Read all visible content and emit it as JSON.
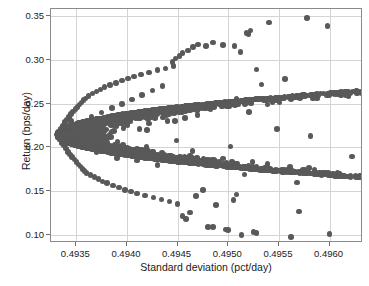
{
  "chart_data": {
    "type": "scatter",
    "title": "",
    "xlabel": "Standard deviation (pct/day)",
    "ylabel": "Return (bps/day)",
    "xlim": [
      0.49325,
      0.49633
    ],
    "ylim": [
      0.0905,
      0.3585
    ],
    "xticks": [
      0.4935,
      0.494,
      0.4945,
      0.495,
      0.4955,
      0.496
    ],
    "xticklabels": [
      "0.4935",
      "0.4940",
      "0.4945",
      "0.4950",
      "0.4955",
      "0.4960"
    ],
    "yticks": [
      0.1,
      0.15,
      0.2,
      0.25,
      0.3,
      0.35
    ],
    "yticklabels": [
      "0.10",
      "0.15",
      "0.20",
      "0.25",
      "0.30",
      "0.35"
    ],
    "grid": true,
    "legend": null,
    "marker_color": "#595959",
    "marker_size_px": 5.6,
    "n_points_drawn": 1000,
    "envelope": {
      "apex_x": 0.49331,
      "apex_y": 0.2145,
      "curvature_note": "left boundary x = apex_x + k*(y-apex_y)^2, k approx 0.00112/unit^2 upper, 0.00118/unit^2 lower"
    },
    "points": [
      [
        0.49331,
        0.2148
      ],
      [
        0.49332,
        0.212
      ],
      [
        0.49333,
        0.218
      ],
      [
        0.49334,
        0.209
      ],
      [
        0.49335,
        0.221
      ],
      [
        0.49336,
        0.205
      ],
      [
        0.49337,
        0.225
      ],
      [
        0.49338,
        0.202
      ],
      [
        0.49339,
        0.229
      ],
      [
        0.4934,
        0.1985
      ],
      [
        0.49341,
        0.232
      ],
      [
        0.49342,
        0.195
      ],
      [
        0.49343,
        0.235
      ],
      [
        0.49344,
        0.192
      ],
      [
        0.49345,
        0.2385
      ],
      [
        0.49346,
        0.189
      ],
      [
        0.49347,
        0.241
      ],
      [
        0.49348,
        0.186
      ],
      [
        0.49349,
        0.244
      ],
      [
        0.4935,
        0.183
      ],
      [
        0.49351,
        0.2465
      ],
      [
        0.49352,
        0.1805
      ],
      [
        0.49353,
        0.249
      ],
      [
        0.49354,
        0.178
      ],
      [
        0.49355,
        0.2515
      ],
      [
        0.49356,
        0.1755
      ],
      [
        0.49357,
        0.254
      ],
      [
        0.49358,
        0.173
      ],
      [
        0.49359,
        0.256
      ],
      [
        0.4936,
        0.171
      ],
      [
        0.49362,
        0.259
      ],
      [
        0.49364,
        0.1685
      ],
      [
        0.49366,
        0.2615
      ],
      [
        0.49368,
        0.166
      ],
      [
        0.4937,
        0.264
      ],
      [
        0.49372,
        0.1635
      ],
      [
        0.49374,
        0.2665
      ],
      [
        0.49376,
        0.161
      ],
      [
        0.49378,
        0.269
      ],
      [
        0.4938,
        0.159
      ],
      [
        0.49383,
        0.2715
      ],
      [
        0.49386,
        0.1565
      ],
      [
        0.49389,
        0.274
      ],
      [
        0.49392,
        0.154
      ],
      [
        0.49395,
        0.2765
      ],
      [
        0.49398,
        0.1515
      ],
      [
        0.49401,
        0.279
      ],
      [
        0.49404,
        0.1495
      ],
      [
        0.49407,
        0.281
      ],
      [
        0.4941,
        0.147
      ],
      [
        0.49414,
        0.2835
      ],
      [
        0.49418,
        0.145
      ],
      [
        0.49422,
        0.286
      ],
      [
        0.49426,
        0.1425
      ],
      [
        0.4943,
        0.2885
      ],
      [
        0.49434,
        0.1405
      ],
      [
        0.49438,
        0.2905
      ],
      [
        0.49442,
        0.138
      ],
      [
        0.49446,
        0.293
      ],
      [
        0.4945,
        0.1355
      ],
      [
        0.4934,
        0.22
      ],
      [
        0.49345,
        0.23
      ],
      [
        0.4935,
        0.215
      ],
      [
        0.49355,
        0.225
      ],
      [
        0.4936,
        0.205
      ],
      [
        0.49365,
        0.235
      ],
      [
        0.4937,
        0.195
      ],
      [
        0.49375,
        0.24
      ],
      [
        0.4938,
        0.21
      ],
      [
        0.49385,
        0.245
      ],
      [
        0.4939,
        0.188
      ],
      [
        0.49395,
        0.25
      ],
      [
        0.494,
        0.2
      ],
      [
        0.49405,
        0.255
      ],
      [
        0.4941,
        0.185
      ],
      [
        0.49415,
        0.26
      ],
      [
        0.4942,
        0.22
      ],
      [
        0.49425,
        0.265
      ],
      [
        0.4943,
        0.18
      ],
      [
        0.49435,
        0.27
      ],
      [
        0.4944,
        0.23
      ],
      [
        0.49445,
        0.298
      ],
      [
        0.49448,
        0.302
      ],
      [
        0.49452,
        0.305
      ],
      [
        0.49455,
        0.308
      ],
      [
        0.4946,
        0.311
      ],
      [
        0.49465,
        0.315
      ],
      [
        0.4947,
        0.318
      ],
      [
        0.49478,
        0.316
      ],
      [
        0.49485,
        0.32
      ],
      [
        0.49495,
        0.317
      ],
      [
        0.4952,
        0.33
      ],
      [
        0.49522,
        0.334
      ],
      [
        0.4954,
        0.343
      ],
      [
        0.49578,
        0.348
      ],
      [
        0.49598,
        0.339
      ],
      [
        0.49512,
        0.309
      ],
      [
        0.49518,
        0.331
      ],
      [
        0.49528,
        0.289
      ],
      [
        0.49533,
        0.272
      ],
      [
        0.49556,
        0.278
      ],
      [
        0.49508,
        0.256
      ],
      [
        0.49548,
        0.221
      ],
      [
        0.49506,
        0.316
      ],
      [
        0.49502,
        0.201
      ],
      [
        0.49516,
        0.169
      ],
      [
        0.49524,
        0.183
      ],
      [
        0.49536,
        0.176
      ],
      [
        0.4954,
        0.174
      ],
      [
        0.49568,
        0.16
      ],
      [
        0.49581,
        0.213
      ],
      [
        0.496,
        0.101
      ],
      [
        0.49562,
        0.0975
      ],
      [
        0.4957,
        0.1265
      ],
      [
        0.49513,
        0.0995
      ],
      [
        0.49525,
        0.103
      ],
      [
        0.49528,
        0.102
      ],
      [
        0.49498,
        0.106
      ],
      [
        0.495,
        0.1055
      ],
      [
        0.4948,
        0.109
      ],
      [
        0.49485,
        0.1085
      ],
      [
        0.49622,
        0.1895
      ],
      [
        0.49505,
        0.14
      ],
      [
        0.49508,
        0.146
      ],
      [
        0.49488,
        0.134
      ],
      [
        0.49475,
        0.151
      ],
      [
        0.49468,
        0.144
      ],
      [
        0.49462,
        0.1255
      ],
      [
        0.49458,
        0.118
      ],
      [
        0.49455,
        0.1215
      ]
    ]
  },
  "axis_titles": {
    "x": "Standard deviation (pct/day)",
    "y": "Return (bps/day)"
  }
}
